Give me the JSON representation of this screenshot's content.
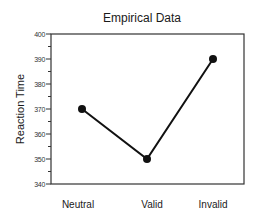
{
  "chart_data": {
    "type": "line",
    "title": "Empirical Data",
    "xlabel": "",
    "ylabel": "Reaction Time",
    "categories": [
      "Neutral",
      "Valid",
      "Invalid"
    ],
    "series": [
      {
        "name": "Reaction Time",
        "values": [
          370,
          350,
          390
        ]
      }
    ],
    "ylim": [
      340,
      400
    ],
    "yticks": [
      340,
      350,
      360,
      370,
      380,
      390,
      400
    ],
    "minor_ticks_every": 5,
    "grid": false,
    "legend": null,
    "colors": {
      "line": "#111111",
      "marker": "#111111",
      "axis": "#333333"
    }
  }
}
